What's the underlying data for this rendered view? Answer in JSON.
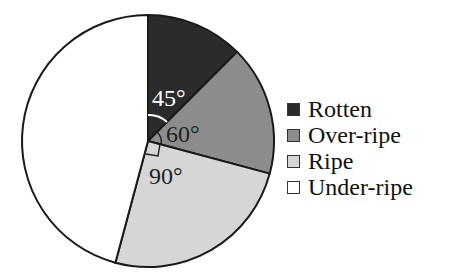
{
  "chart_data": {
    "type": "pie",
    "title": "",
    "categories": [
      "Rotten",
      "Over-ripe",
      "Ripe",
      "Under-ripe"
    ],
    "values": [
      45,
      60,
      90,
      165
    ],
    "unit": "degrees",
    "colors": [
      "#2b2b2b",
      "#8c8c8c",
      "#d6d6d6",
      "#ffffff"
    ],
    "start_angle": "12 o'clock, clockwise",
    "annotations": [
      {
        "text": "45°",
        "slice": "Rotten"
      },
      {
        "text": "60°",
        "slice": "Over-ripe"
      },
      {
        "text": "90°",
        "slice": "Ripe",
        "marker": "right-angle"
      }
    ],
    "legend_position": "right"
  },
  "legend": {
    "items": [
      {
        "label": "Rotten",
        "color": "#2b2b2b"
      },
      {
        "label": "Over-ripe",
        "color": "#8c8c8c"
      },
      {
        "label": "Ripe",
        "color": "#d6d6d6"
      },
      {
        "label": "Under-ripe",
        "color": "#ffffff"
      }
    ]
  },
  "labels": {
    "rotten_angle": "45°",
    "overripe_angle": "60°",
    "ripe_angle": "90°"
  }
}
